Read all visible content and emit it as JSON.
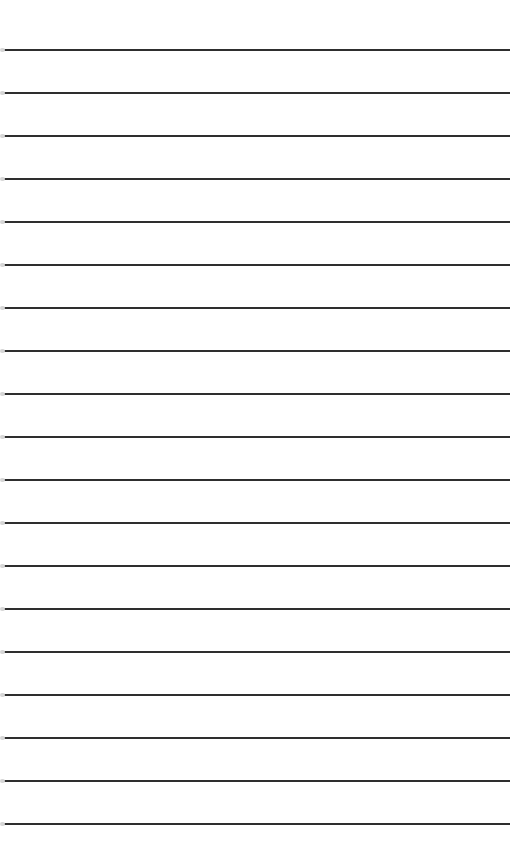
{
  "page": {
    "type": "lined-paper",
    "background_color": "#ffffff",
    "line_color": "#2e2e2e",
    "line_count": 19,
    "first_line_y": 50,
    "line_spacing": 43,
    "lines": [
      50,
      93,
      136,
      179,
      222,
      265,
      308,
      351,
      394,
      437,
      480,
      523,
      566,
      609,
      652,
      695,
      738,
      781,
      824
    ]
  }
}
